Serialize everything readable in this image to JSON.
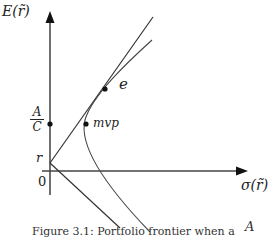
{
  "diagram": {
    "type": "mean-variance frontier",
    "y_axis_label": "E(r̃)",
    "x_axis_label": "σ(r̃)",
    "origin_label": "0",
    "risk_free_label": "r",
    "ratio_label": {
      "numerator": "A",
      "denominator": "C"
    },
    "points": [
      {
        "name": "e",
        "label": "e"
      },
      {
        "name": "mvp",
        "label": "mvp"
      }
    ],
    "elements": [
      "vertical axis with arrow",
      "horizontal axis with arrow",
      "upper tangent line from r through e",
      "lower line from r",
      "hyperbola frontier through e and mvp",
      "dot at A/C on vertical axis"
    ],
    "caption": "Figure 3.1: Portfolio frontier when a",
    "caption_tail": "A"
  },
  "colors": {
    "lines": "#333333",
    "text": "#222222",
    "background": "#ffffff"
  }
}
